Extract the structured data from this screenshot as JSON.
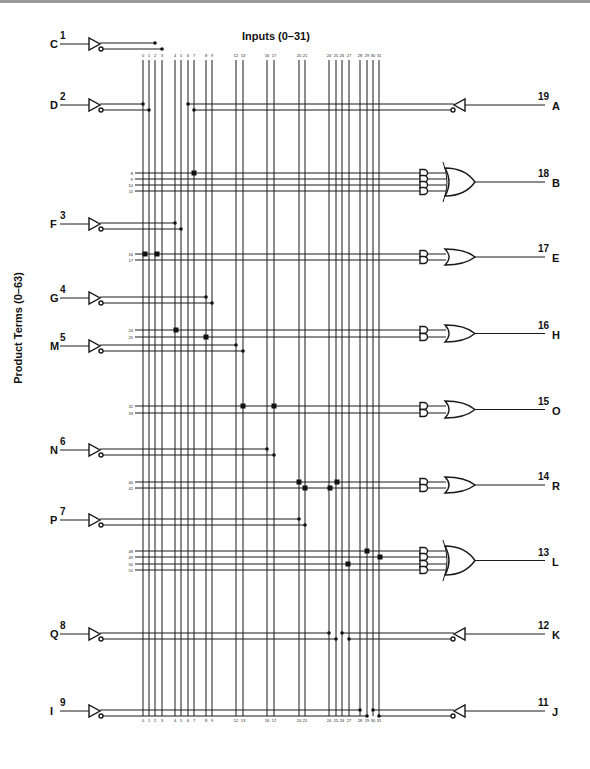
{
  "title": "Inputs (0–31)",
  "ylabel": "Product Terms (0–63)",
  "columns": [
    {
      "n": "0",
      "x": 143
    },
    {
      "n": "1",
      "x": 149
    },
    {
      "n": "2",
      "x": 155
    },
    {
      "n": "3",
      "x": 162
    },
    {
      "n": "4",
      "x": 175
    },
    {
      "n": "5",
      "x": 181
    },
    {
      "n": "6",
      "x": 188
    },
    {
      "n": "7",
      "x": 194
    },
    {
      "n": "8",
      "x": 206
    },
    {
      "n": "9",
      "x": 212
    },
    {
      "n": "12",
      "x": 236
    },
    {
      "n": "13",
      "x": 243
    },
    {
      "n": "16",
      "x": 267
    },
    {
      "n": "17",
      "x": 274
    },
    {
      "n": "20",
      "x": 299
    },
    {
      "n": "21",
      "x": 305
    },
    {
      "n": "24",
      "x": 329
    },
    {
      "n": "25",
      "x": 336
    },
    {
      "n": "26",
      "x": 342
    },
    {
      "n": "27",
      "x": 349
    },
    {
      "n": "28",
      "x": 360
    },
    {
      "n": "29",
      "x": 367
    },
    {
      "n": "30",
      "x": 373
    },
    {
      "n": "31",
      "x": 379
    }
  ],
  "inputs": [
    {
      "pin": "1",
      "name": "C",
      "y": 44,
      "cols": [
        155,
        162
      ]
    },
    {
      "pin": "2",
      "name": "D",
      "y": 105,
      "cols": [
        143,
        149
      ]
    },
    {
      "pin": "3",
      "name": "F",
      "y": 224,
      "cols": [
        175,
        181
      ]
    },
    {
      "pin": "4",
      "name": "G",
      "y": 298,
      "cols": [
        206,
        212
      ]
    },
    {
      "pin": "5",
      "name": "M",
      "y": 346,
      "cols": [
        236,
        243
      ]
    },
    {
      "pin": "6",
      "name": "N",
      "y": 450,
      "cols": [
        267,
        274
      ]
    },
    {
      "pin": "7",
      "name": "P",
      "y": 520,
      "cols": [
        299,
        305
      ]
    },
    {
      "pin": "8",
      "name": "Q",
      "y": 634,
      "cols": [
        329,
        336
      ]
    },
    {
      "pin": "9",
      "name": "I",
      "y": 711,
      "cols": [
        360,
        367
      ]
    }
  ],
  "io_outputs": [
    {
      "pin": "19",
      "name": "A",
      "y": 105,
      "cols": [
        188,
        194
      ]
    },
    {
      "pin": "12",
      "name": "K",
      "y": 634,
      "cols": [
        342,
        349
      ]
    },
    {
      "pin": "11",
      "name": "J",
      "y": 711,
      "cols": [
        373,
        379
      ]
    }
  ],
  "or_outputs": [
    {
      "pin": "18",
      "name": "B",
      "terms": [
        {
          "n": "8",
          "y": 173
        },
        {
          "n": "9",
          "y": 179
        },
        {
          "n": "10",
          "y": 185
        },
        {
          "n": "11",
          "y": 191
        }
      ],
      "fuses": [
        [
          194,
          173
        ]
      ]
    },
    {
      "pin": "17",
      "name": "E",
      "terms": [
        {
          "n": "16",
          "y": 254
        },
        {
          "n": "17",
          "y": 260
        }
      ],
      "fuses": [
        [
          145,
          254
        ],
        [
          157,
          254
        ]
      ]
    },
    {
      "pin": "16",
      "name": "H",
      "terms": [
        {
          "n": "24",
          "y": 330
        },
        {
          "n": "25",
          "y": 337
        }
      ],
      "fuses": [
        [
          176,
          330
        ],
        [
          206,
          337
        ]
      ]
    },
    {
      "pin": "15",
      "name": "O",
      "terms": [
        {
          "n": "32",
          "y": 406
        },
        {
          "n": "33",
          "y": 413
        }
      ],
      "fuses": [
        [
          243,
          406
        ],
        [
          274,
          406
        ]
      ]
    },
    {
      "pin": "14",
      "name": "R",
      "terms": [
        {
          "n": "40",
          "y": 482
        },
        {
          "n": "41",
          "y": 488
        }
      ],
      "fuses": [
        [
          299,
          482
        ],
        [
          337,
          482
        ],
        [
          305,
          488
        ],
        [
          330,
          488
        ]
      ]
    },
    {
      "pin": "13",
      "name": "L",
      "terms": [
        {
          "n": "48",
          "y": 551
        },
        {
          "n": "49",
          "y": 557
        },
        {
          "n": "50",
          "y": 564
        },
        {
          "n": "51",
          "y": 570
        }
      ],
      "fuses": [
        [
          367,
          551
        ],
        [
          380,
          557
        ],
        [
          348,
          564
        ]
      ]
    }
  ],
  "colors": {
    "ink": "#1a1a1a",
    "background": "#ffffff"
  }
}
